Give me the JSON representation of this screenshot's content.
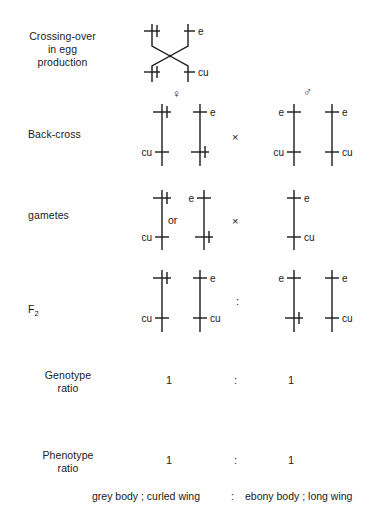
{
  "figure": {
    "rows": [
      {
        "id": "crossing-over",
        "label": "Crossing-over\nin egg\nproduction"
      },
      {
        "id": "back-cross",
        "label": "Back-cross"
      },
      {
        "id": "gametes",
        "label": "gametes"
      },
      {
        "id": "f2",
        "label_main": "F",
        "label_sub": "2"
      },
      {
        "id": "genotype-ratio",
        "label": "Genotype\nratio"
      },
      {
        "id": "phenotype-ratio",
        "label": "Phenotype\nratio"
      }
    ],
    "symbols": {
      "female": "♀",
      "male": "♂",
      "cross": "×",
      "colon": ":",
      "or": "or",
      "plus": "+"
    },
    "alleles": {
      "wild": "+",
      "ebony": "e",
      "curled": "cu"
    },
    "crossing_over": {
      "left_top": "+",
      "right_top": "e",
      "left_bottom": "+",
      "right_bottom": "cu"
    },
    "back_cross": {
      "female_marker": "♀",
      "male_marker": "♂",
      "operator": "×",
      "female": [
        {
          "top": "+",
          "bottom": "cu",
          "top_side": "left",
          "bottom_side": "left"
        },
        {
          "top": "e",
          "bottom": "+",
          "top_side": "right",
          "bottom_side": "right"
        }
      ],
      "male": [
        {
          "top": "e",
          "bottom": "cu",
          "top_side": "left",
          "bottom_side": "left"
        },
        {
          "top": "e",
          "bottom": "cu",
          "top_side": "right",
          "bottom_side": "right"
        }
      ]
    },
    "gametes": {
      "operator": "×",
      "or_label": "or",
      "female": [
        {
          "top": "+",
          "bottom": "cu",
          "top_side": "left",
          "bottom_side": "left"
        },
        {
          "top": "e",
          "bottom": "+",
          "top_side": "left",
          "bottom_side": "left"
        }
      ],
      "male": [
        {
          "top": "e",
          "bottom": "cu",
          "top_side": "right",
          "bottom_side": "right"
        }
      ]
    },
    "f2": {
      "operator": ":",
      "left_pair": [
        {
          "top": "+",
          "bottom": "cu",
          "top_side": "left",
          "bottom_side": "left"
        },
        {
          "top": "e",
          "bottom": "cu",
          "top_side": "right",
          "bottom_side": "right"
        }
      ],
      "right_pair": [
        {
          "top": "e",
          "bottom": "+",
          "top_side": "left",
          "bottom_side": "left"
        },
        {
          "top": "e",
          "bottom": "cu",
          "top_side": "right",
          "bottom_side": "right"
        }
      ]
    },
    "genotype_ratio": {
      "left": "1",
      "operator": ":",
      "right": "1"
    },
    "phenotype_ratio": {
      "left": "1",
      "operator": ":",
      "right": "1"
    },
    "caption": {
      "left": "grey body ; curled wing",
      "operator": ":",
      "right": "ebony body ; long wing"
    },
    "colors": {
      "ink": "#1a1a1a",
      "background": "#ffffff"
    }
  }
}
